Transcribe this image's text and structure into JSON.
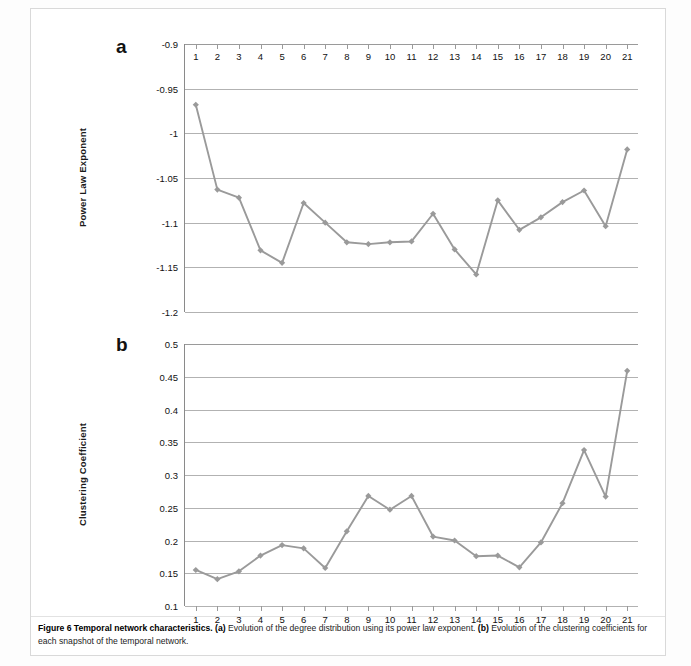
{
  "figure": {
    "caption_label": "Figure 6",
    "caption_title": "Temporal network characteristics.",
    "caption_a_tag": "(a)",
    "caption_a_text": " Evolution of the degree distribution using its power law exponent. ",
    "caption_b_tag": "(b)",
    "caption_b_text": " Evolution of the clustering coefficients for each snapshot of the temporal network.",
    "series_color": "#9a9a9a",
    "grid_color": "#b2b2b2",
    "axis_color": "#8a8a8a"
  },
  "panel_a": {
    "letter": "a",
    "ylabel": "Power Law Exponent"
  },
  "panel_b": {
    "letter": "b",
    "ylabel": "Clustering Coefficient"
  },
  "chart_data": [
    {
      "type": "line",
      "panel": "a",
      "title": "Evolution of the degree distribution using its power law exponent",
      "xlabel": "",
      "ylabel": "Power Law Exponent",
      "x": [
        1,
        2,
        3,
        4,
        5,
        6,
        7,
        8,
        9,
        10,
        11,
        12,
        13,
        14,
        15,
        16,
        17,
        18,
        19,
        20,
        21
      ],
      "categories": [
        "1",
        "2",
        "3",
        "4",
        "5",
        "6",
        "7",
        "8",
        "9",
        "10",
        "11",
        "12",
        "13",
        "14",
        "15",
        "16",
        "17",
        "18",
        "19",
        "20",
        "21"
      ],
      "values": [
        -0.968,
        -1.063,
        -1.072,
        -1.131,
        -1.145,
        -1.078,
        -1.1,
        -1.122,
        -1.124,
        -1.122,
        -1.121,
        -1.09,
        -1.13,
        -1.158,
        -1.075,
        -1.108,
        -1.094,
        -1.077,
        -1.064,
        -1.104,
        -1.018
      ],
      "yticks": [
        -0.9,
        -0.95,
        -1,
        -1.05,
        -1.1,
        -1.15,
        -1.2
      ],
      "ytick_labels": [
        "-0.9",
        "-0.95",
        "-1",
        "-1.05",
        "-1.1",
        "-1.15",
        "-1.2"
      ],
      "ylim": [
        -1.2,
        -0.9
      ],
      "xlim": [
        0.5,
        21.5
      ],
      "grid": true,
      "legend": "none",
      "marker": "diamond",
      "xaxis_position": "top"
    },
    {
      "type": "line",
      "panel": "b",
      "title": "Evolution of the clustering coefficients for each snapshot of the temporal network",
      "xlabel": "",
      "ylabel": "Clustering Coefficient",
      "x": [
        1,
        2,
        3,
        4,
        5,
        6,
        7,
        8,
        9,
        10,
        11,
        12,
        13,
        14,
        15,
        16,
        17,
        18,
        19,
        20,
        21
      ],
      "categories": [
        "1",
        "2",
        "3",
        "4",
        "5",
        "6",
        "7",
        "8",
        "9",
        "10",
        "11",
        "12",
        "13",
        "14",
        "15",
        "16",
        "17",
        "18",
        "19",
        "20",
        "21"
      ],
      "values": [
        0.155,
        0.141,
        0.153,
        0.177,
        0.193,
        0.188,
        0.158,
        0.214,
        0.268,
        0.247,
        0.268,
        0.206,
        0.2,
        0.176,
        0.177,
        0.159,
        0.197,
        0.257,
        0.338,
        0.267,
        0.459
      ],
      "yticks": [
        0.5,
        0.45,
        0.4,
        0.35,
        0.3,
        0.25,
        0.2,
        0.15,
        0.1
      ],
      "ytick_labels": [
        "0.5",
        "0.45",
        "0.4",
        "0.35",
        "0.3",
        "0.25",
        "0.2",
        "0.15",
        "0.1"
      ],
      "ylim": [
        0.1,
        0.5
      ],
      "xlim": [
        0.5,
        21.5
      ],
      "grid": true,
      "legend": "none",
      "marker": "diamond",
      "xaxis_position": "bottom"
    }
  ]
}
